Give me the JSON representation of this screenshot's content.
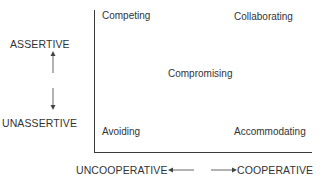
{
  "diagram": {
    "type": "conflict-styles-grid",
    "y_axis": {
      "top_label": "ASSERTIVE",
      "bottom_label": "UNASSERTIVE"
    },
    "x_axis": {
      "left_label": "UNCOOPERATIVE",
      "right_label": "COOPERATIVE"
    },
    "quadrants": {
      "top_left": "Competing",
      "top_right": "Collaborating",
      "center": "Compromising",
      "bottom_left": "Avoiding",
      "bottom_right": "Accommodating"
    },
    "colors": {
      "line": "#3a3a3a",
      "text": "#333333",
      "arrow": "#666666"
    }
  }
}
